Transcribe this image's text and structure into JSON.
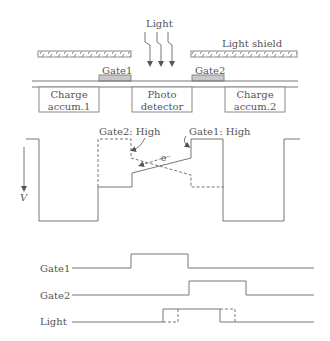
{
  "structure": {
    "light_label": "Light",
    "light_shield_label": "Light shield",
    "gate1_label": "Gate1",
    "gate2_label": "Gate2",
    "charge_accum1_line1": "Charge",
    "charge_accum1_line2": "accum.1",
    "photo_detector_line1": "Photo",
    "photo_detector_line2": "detector",
    "charge_accum2_line1": "Charge",
    "charge_accum2_line2": "accum.2",
    "gate_color": "#c8c8c8"
  },
  "potential": {
    "gate2_high_label": "Gate2: High",
    "gate1_high_label": "Gate1: High",
    "electron_label": "e⁻",
    "axis_label": "V"
  },
  "timing": {
    "signals": [
      {
        "name": "Gate1"
      },
      {
        "name": "Gate2"
      },
      {
        "name": "Light"
      }
    ]
  }
}
